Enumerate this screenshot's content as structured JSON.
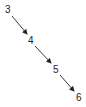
{
  "diagram": {
    "type": "chain",
    "nodes": [
      {
        "label": "3",
        "x": 5,
        "y": 5
      },
      {
        "label": "4",
        "x": 28,
        "y": 36
      },
      {
        "label": "5",
        "x": 53,
        "y": 65
      },
      {
        "label": "6",
        "x": 76,
        "y": 93
      }
    ],
    "edges": [
      {
        "from": "3",
        "to": "4"
      },
      {
        "from": "4",
        "to": "5"
      },
      {
        "from": "5",
        "to": "6"
      }
    ],
    "colors": {
      "edge": "#222222",
      "text": "#222222"
    }
  }
}
